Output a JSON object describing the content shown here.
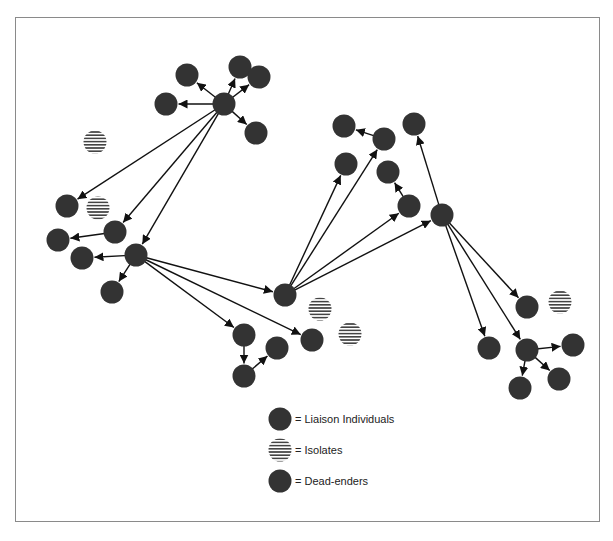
{
  "diagram": {
    "type": "network",
    "colors": {
      "node": "#333333",
      "edge": "#111111",
      "isolate_stripe": "#444444",
      "frame": "#8a8a8a"
    },
    "node_radius": 11.5,
    "nodes": [
      {
        "id": "h1",
        "x": 224,
        "y": 104,
        "kind": "liaison"
      },
      {
        "id": "a1",
        "x": 187,
        "y": 75,
        "kind": "dead"
      },
      {
        "id": "a2",
        "x": 240,
        "y": 67,
        "kind": "dead"
      },
      {
        "id": "a3",
        "x": 259,
        "y": 77,
        "kind": "dead"
      },
      {
        "id": "a4",
        "x": 166,
        "y": 104,
        "kind": "dead"
      },
      {
        "id": "a5",
        "x": 256,
        "y": 133,
        "kind": "dead"
      },
      {
        "id": "i1",
        "x": 95,
        "y": 142,
        "kind": "isolate"
      },
      {
        "id": "b1",
        "x": 67,
        "y": 206,
        "kind": "dead"
      },
      {
        "id": "i2",
        "x": 98,
        "y": 208,
        "kind": "isolate"
      },
      {
        "id": "b2",
        "x": 115,
        "y": 232,
        "kind": "liaison"
      },
      {
        "id": "b3",
        "x": 58,
        "y": 240,
        "kind": "dead"
      },
      {
        "id": "h2",
        "x": 136,
        "y": 255,
        "kind": "liaison"
      },
      {
        "id": "b4",
        "x": 82,
        "y": 258,
        "kind": "dead"
      },
      {
        "id": "b5",
        "x": 112,
        "y": 292,
        "kind": "dead"
      },
      {
        "id": "h3",
        "x": 285,
        "y": 295,
        "kind": "liaison"
      },
      {
        "id": "i3",
        "x": 320,
        "y": 309,
        "kind": "isolate"
      },
      {
        "id": "c1",
        "x": 244,
        "y": 335,
        "kind": "liaison"
      },
      {
        "id": "c2",
        "x": 277,
        "y": 348,
        "kind": "dead"
      },
      {
        "id": "c3",
        "x": 312,
        "y": 340,
        "kind": "dead"
      },
      {
        "id": "i4",
        "x": 350,
        "y": 334,
        "kind": "isolate"
      },
      {
        "id": "c4",
        "x": 244,
        "y": 376,
        "kind": "liaison"
      },
      {
        "id": "d1",
        "x": 344,
        "y": 126,
        "kind": "dead"
      },
      {
        "id": "d2",
        "x": 384,
        "y": 139,
        "kind": "liaison"
      },
      {
        "id": "d3",
        "x": 414,
        "y": 124,
        "kind": "dead"
      },
      {
        "id": "d4",
        "x": 346,
        "y": 164,
        "kind": "dead"
      },
      {
        "id": "d5",
        "x": 388,
        "y": 172,
        "kind": "dead"
      },
      {
        "id": "d6",
        "x": 409,
        "y": 206,
        "kind": "liaison"
      },
      {
        "id": "h4",
        "x": 442,
        "y": 215,
        "kind": "liaison"
      },
      {
        "id": "e1",
        "x": 527,
        "y": 307,
        "kind": "dead"
      },
      {
        "id": "i5",
        "x": 560,
        "y": 302,
        "kind": "isolate"
      },
      {
        "id": "e2",
        "x": 489,
        "y": 348,
        "kind": "dead"
      },
      {
        "id": "e3",
        "x": 527,
        "y": 350,
        "kind": "liaison"
      },
      {
        "id": "e4",
        "x": 573,
        "y": 345,
        "kind": "dead"
      },
      {
        "id": "e5",
        "x": 559,
        "y": 379,
        "kind": "dead"
      },
      {
        "id": "e6",
        "x": 520,
        "y": 388,
        "kind": "dead"
      }
    ],
    "edges": [
      [
        "h1",
        "a1"
      ],
      [
        "h1",
        "a2"
      ],
      [
        "h1",
        "a3"
      ],
      [
        "h1",
        "a4"
      ],
      [
        "h1",
        "a5"
      ],
      [
        "h1",
        "b1"
      ],
      [
        "h1",
        "b2"
      ],
      [
        "h1",
        "h2"
      ],
      [
        "b2",
        "b3"
      ],
      [
        "h2",
        "b4"
      ],
      [
        "h2",
        "b5"
      ],
      [
        "h2",
        "h3"
      ],
      [
        "h2",
        "c1"
      ],
      [
        "h2",
        "c3"
      ],
      [
        "c1",
        "c4"
      ],
      [
        "c4",
        "c2"
      ],
      [
        "h3",
        "d4"
      ],
      [
        "h3",
        "d2"
      ],
      [
        "h3",
        "d6"
      ],
      [
        "h3",
        "h4"
      ],
      [
        "d2",
        "d1"
      ],
      [
        "d6",
        "d5"
      ],
      [
        "h4",
        "d3"
      ],
      [
        "h4",
        "e1"
      ],
      [
        "h4",
        "e2"
      ],
      [
        "h4",
        "e3"
      ],
      [
        "e3",
        "e4"
      ],
      [
        "e3",
        "e5"
      ],
      [
        "e3",
        "e6"
      ]
    ]
  },
  "legend": {
    "items": [
      {
        "kind": "liaison",
        "label": "= Liaison Individuals",
        "x": 280,
        "y": 419
      },
      {
        "kind": "isolate",
        "label": "= Isolates",
        "x": 280,
        "y": 450
      },
      {
        "kind": "dead",
        "label": "= Dead-enders",
        "x": 280,
        "y": 481
      }
    ]
  }
}
